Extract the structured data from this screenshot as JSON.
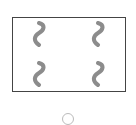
{
  "card": {
    "shape": "squiggle",
    "count": 4,
    "color": "#8c8c8c",
    "border_color": "#444444",
    "symbols": [
      {
        "x": 31,
        "y": 20
      },
      {
        "x": 90,
        "y": 20
      },
      {
        "x": 31,
        "y": 60
      },
      {
        "x": 90,
        "y": 60
      }
    ]
  },
  "option": {
    "type": "radio",
    "selected": false,
    "border_color": "#bbbbbb"
  }
}
